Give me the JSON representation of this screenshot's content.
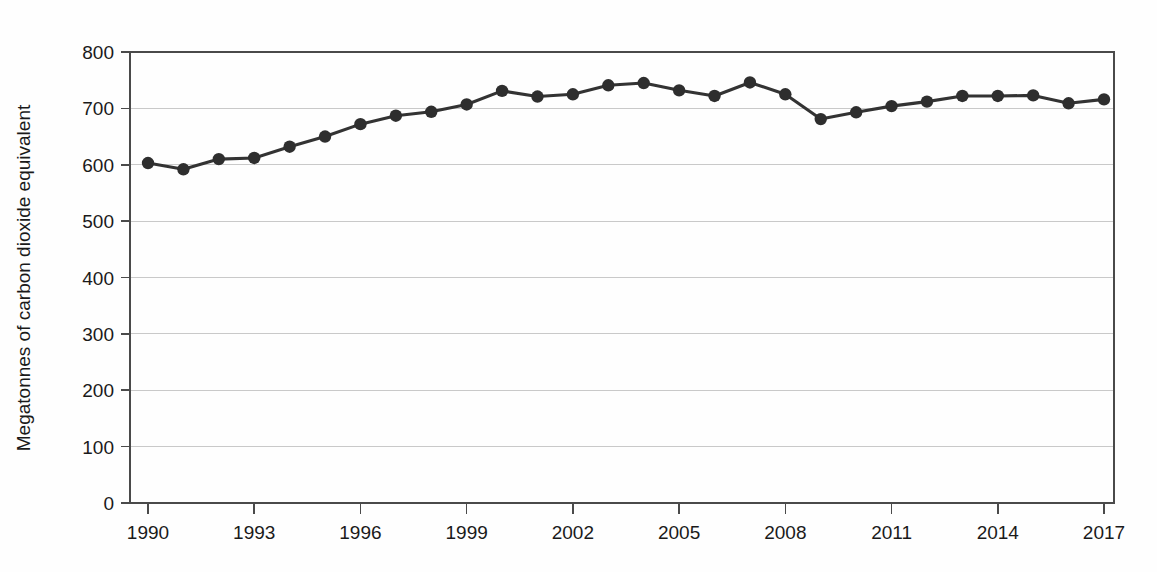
{
  "chart_data": {
    "type": "line",
    "title": "",
    "subtitle": "",
    "xlabel": "",
    "ylabel": "Megatonnes of carbon dioxide equivalent",
    "xlim": [
      1990,
      2017
    ],
    "ylim": [
      0,
      800
    ],
    "grid": true,
    "legend": null,
    "legend_position": "none",
    "y_ticks": [
      0,
      100,
      200,
      300,
      400,
      500,
      600,
      700,
      800
    ],
    "y_tick_labels": [
      "0",
      "100",
      "200",
      "300",
      "400",
      "500",
      "600",
      "700",
      "800"
    ],
    "x_ticks": [
      1990,
      1993,
      1996,
      1999,
      2002,
      2005,
      2008,
      2011,
      2014,
      2017
    ],
    "x_tick_labels": [
      "1990",
      "1993",
      "1996",
      "1999",
      "2002",
      "2005",
      "2008",
      "2011",
      "2014",
      "2017"
    ],
    "x": [
      1990,
      1991,
      1992,
      1993,
      1994,
      1995,
      1996,
      1997,
      1998,
      1999,
      2000,
      2001,
      2002,
      2003,
      2004,
      2005,
      2006,
      2007,
      2008,
      2009,
      2010,
      2011,
      2012,
      2013,
      2014,
      2015,
      2016,
      2017
    ],
    "values": [
      603,
      592,
      610,
      612,
      632,
      650,
      672,
      687,
      694,
      707,
      731,
      721,
      725,
      741,
      745,
      732,
      722,
      746,
      725,
      681,
      693,
      704,
      712,
      722,
      722,
      723,
      709,
      716
    ],
    "series": [
      {
        "name": "Total greenhouse gas emissions",
        "color": "#2e2e2e",
        "marker": "circle",
        "values": [
          603,
          592,
          610,
          612,
          632,
          650,
          672,
          687,
          694,
          707,
          731,
          721,
          725,
          741,
          745,
          732,
          722,
          746,
          725,
          681,
          693,
          704,
          712,
          722,
          722,
          723,
          709,
          716
        ]
      }
    ],
    "annotations": [],
    "units": "Megatonnes of carbon dioxide equivalent"
  },
  "colors": {
    "series": "#2e2e2e",
    "grid": "#c9c9c9",
    "axis": "#4a4a4a",
    "text": "#1a1a1a",
    "background": "#fefefe"
  }
}
